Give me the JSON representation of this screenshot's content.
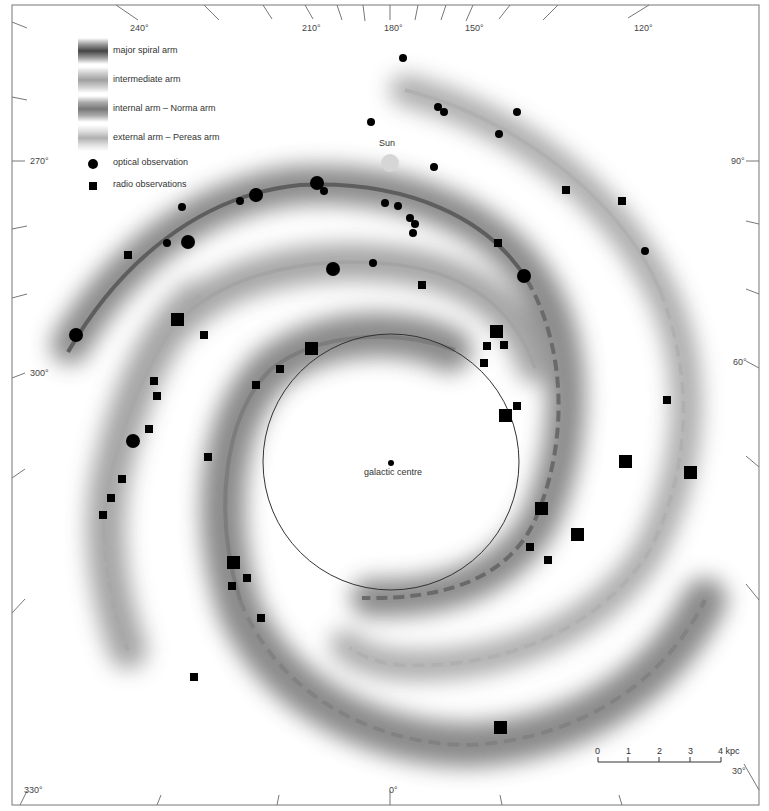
{
  "legend": {
    "items": [
      {
        "label": "major spiral arm",
        "swatch_color": "#555555"
      },
      {
        "label": "intermediate arm",
        "swatch_color": "#a0a0a0"
      },
      {
        "label": "internal arm – Norma arm",
        "swatch_color": "#808080"
      },
      {
        "label": "external arm – Pereas arm",
        "swatch_color": "#b0b0b0"
      }
    ],
    "symbols": [
      {
        "label": "optical observation",
        "shape": "circle"
      },
      {
        "label": "radio observations",
        "shape": "square"
      }
    ]
  },
  "annotations": {
    "sun": "Sun",
    "galactic_centre": "galactic centre"
  },
  "angles": {
    "a240": "240°",
    "a210": "210°",
    "a180": "180°",
    "a150": "150°",
    "a120": "120°",
    "a270": "270°",
    "a300": "300°",
    "a90": "90°",
    "a60": "60°",
    "a330": "330°",
    "a0": "0°",
    "a30": "30°"
  },
  "scale_bar": {
    "ticks": [
      "0",
      "1",
      "2",
      "3",
      "4 kpc"
    ],
    "unit": "kpc"
  },
  "colors": {
    "major_arm": "#606060",
    "intermediate_arm": "#a8a8a8",
    "norma_arm": "#7a7a7a",
    "pereas_arm": "#b4b4b4",
    "glow": "#7d7d7d",
    "sun": "#d6d6d6",
    "marker": "#000000"
  }
}
